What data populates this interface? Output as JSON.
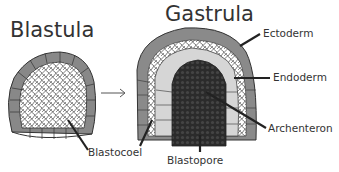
{
  "titles": {
    "blastula": "Blastula",
    "gastrula": "Gastrula"
  },
  "labels": {
    "ectoderm": "Ectoderm",
    "endoderm": "Endoderm",
    "archenteron": "Archenteron",
    "blastocoel": "Blastocoel",
    "blastopore": "Blastopore"
  },
  "arrow": "→",
  "colors": {
    "outer_cells": "#8a8a8a",
    "inner_cells": "#d8d8d8",
    "archenteron": "#2a2a2a",
    "lines": "#222222",
    "text": "#333333"
  }
}
